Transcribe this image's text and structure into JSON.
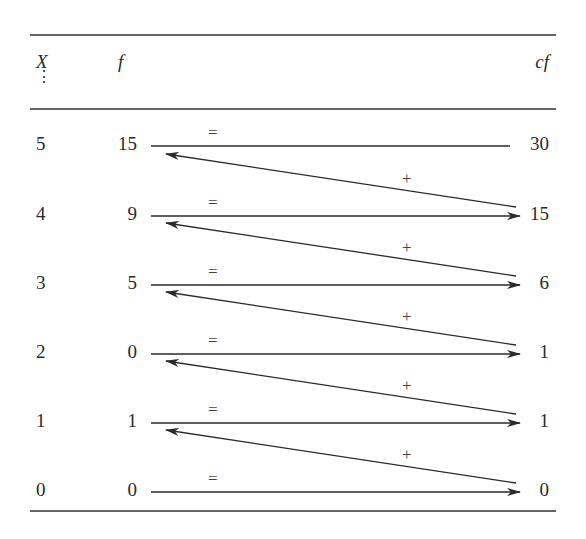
{
  "table": {
    "headers": {
      "x": "X",
      "f": "f",
      "cf": "cf",
      "x_ellipsis": "⋮"
    },
    "rows": [
      {
        "x": "5",
        "f": "15",
        "cf": "30"
      },
      {
        "x": "4",
        "f": "9",
        "cf": "15"
      },
      {
        "x": "3",
        "f": "5",
        "cf": "6"
      },
      {
        "x": "2",
        "f": "0",
        "cf": "1"
      },
      {
        "x": "1",
        "f": "1",
        "cf": "1"
      },
      {
        "x": "0",
        "f": "0",
        "cf": "0"
      }
    ],
    "equal_symbol": "=",
    "plus_symbol": "+"
  },
  "colors": {
    "ink": "#2a2a2a",
    "rule": "#333333"
  }
}
